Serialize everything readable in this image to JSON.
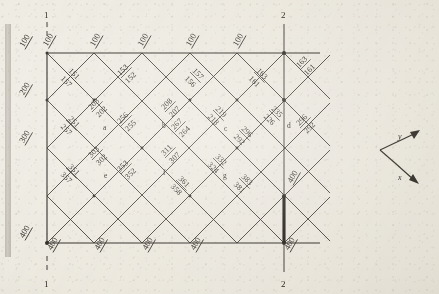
{
  "figure": {
    "type": "structural-grid-diagram",
    "ink_color": "#2b2721",
    "paper_color": "#efece4"
  },
  "section_markers": {
    "top_left": "1",
    "top_right": "2",
    "bottom_left": "1",
    "bottom_right": "2"
  },
  "edge_labels": {
    "top": [
      "100",
      "100",
      "100",
      "100",
      "100"
    ],
    "bottom": [
      "400",
      "400",
      "400",
      "400",
      "400"
    ],
    "left": [
      "100",
      "200",
      "300",
      "400"
    ],
    "right_outside": [
      "163",
      "161",
      "296",
      "292",
      "400"
    ]
  },
  "nodes": [
    {
      "id": "a",
      "label": "a"
    },
    {
      "id": "b",
      "label": "b"
    },
    {
      "id": "c",
      "label": "c"
    },
    {
      "id": "d",
      "label": "d"
    },
    {
      "id": "e",
      "label": "e"
    },
    {
      "id": "f",
      "label": "f"
    },
    {
      "id": "g",
      "label": "g"
    }
  ],
  "member_labels": [
    {
      "upper": "151",
      "lower": "157"
    },
    {
      "upper": "153",
      "lower": "152"
    },
    {
      "upper": "157",
      "lower": "156"
    },
    {
      "upper": "163",
      "lower": "161"
    },
    {
      "upper": "163",
      "lower": "161"
    },
    {
      "upper": "203",
      "lower": "202"
    },
    {
      "upper": "208",
      "lower": "207"
    },
    {
      "upper": "219",
      "lower": "218"
    },
    {
      "upper": "235",
      "lower": "226"
    },
    {
      "upper": "251",
      "lower": "257"
    },
    {
      "upper": "256",
      "lower": "255"
    },
    {
      "upper": "267",
      "lower": "264"
    },
    {
      "upper": "296",
      "lower": "292"
    },
    {
      "upper": "296",
      "lower": "292"
    },
    {
      "upper": "303",
      "lower": "302"
    },
    {
      "upper": "311",
      "lower": "307"
    },
    {
      "upper": "332",
      "lower": "324"
    },
    {
      "upper": "351",
      "lower": "357"
    },
    {
      "upper": "353",
      "lower": "352"
    },
    {
      "upper": "361",
      "lower": "358"
    },
    {
      "upper": "383",
      "lower": "381"
    },
    {
      "upper": "400",
      "lower": ""
    }
  ],
  "axis_indicator": {
    "y_label": "y",
    "x_label": "x"
  }
}
